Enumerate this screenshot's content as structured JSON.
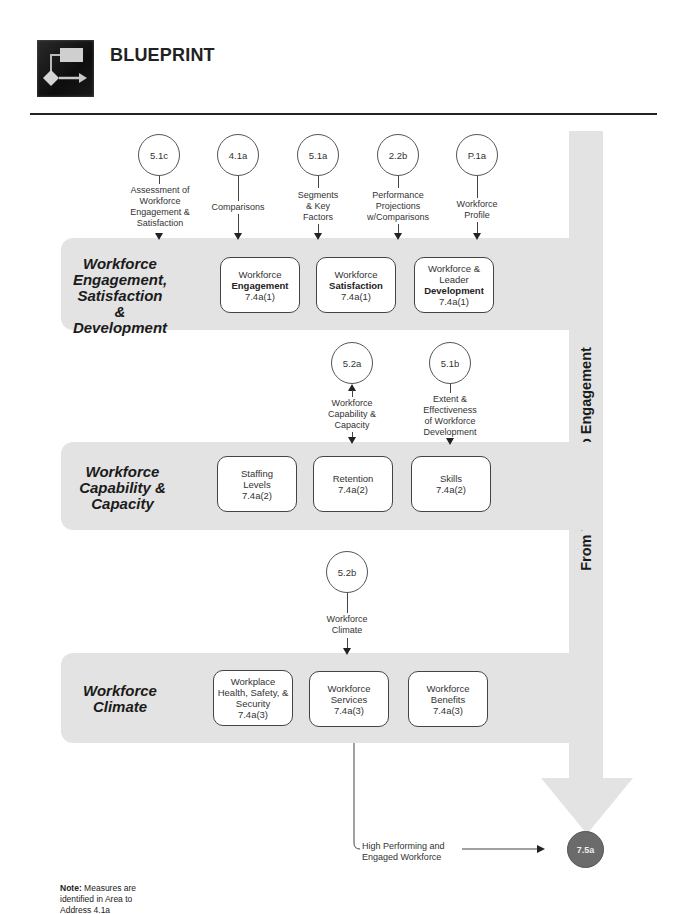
{
  "header": {
    "logo_icon": "flowchart-blueprint-icon",
    "title": "BLUEPRINT"
  },
  "flow_label": "From Well-Being to Engagement",
  "bands": [
    {
      "label": "Workforce Engagement, Satisfaction & Development",
      "label_lines": [
        "Workforce",
        "Engagement,",
        "Satisfaction &",
        "Development"
      ],
      "inputs": [
        {
          "ref": "5.1c",
          "label_lines": [
            "Assessment of",
            "Workforce",
            "Engagement &",
            "Satisfaction"
          ]
        },
        {
          "ref": "4.1a",
          "label_lines": [
            "Comparisons"
          ]
        },
        {
          "ref": "5.1a",
          "label_lines": [
            "Segments",
            "& Key",
            "Factors"
          ]
        },
        {
          "ref": "2.2b",
          "label_lines": [
            "Performance",
            "Projections",
            "w/Comparisons"
          ]
        },
        {
          "ref": "P.1a",
          "label_lines": [
            "Workforce",
            "Profile"
          ]
        }
      ],
      "boxes": [
        {
          "line1": "Workforce",
          "bold": "Engagement",
          "ref": "7.4a(1)"
        },
        {
          "line1": "Workforce",
          "bold": "Satisfaction",
          "ref": "7.4a(1)"
        },
        {
          "line1": "Workforce &",
          "line2": "Leader",
          "bold": "Development",
          "ref": "7.4a(1)"
        }
      ]
    },
    {
      "label": "Workforce Capability & Capacity",
      "label_lines": [
        "Workforce",
        "Capability &",
        "Capacity"
      ],
      "inputs": [
        {
          "ref": "5.2a",
          "label_lines": [
            "Workforce",
            "Capability &",
            "Capacity"
          ],
          "bidirectional": true
        },
        {
          "ref": "5.1b",
          "label_lines": [
            "Extent &",
            "Effectiveness",
            "of Workforce",
            "Development"
          ]
        }
      ],
      "boxes": [
        {
          "line1": "Staffing",
          "line2": "Levels",
          "ref": "7.4a(2)"
        },
        {
          "line1": "Retention",
          "ref": "7.4a(2)"
        },
        {
          "line1": "Skills",
          "ref": "7.4a(2)"
        }
      ]
    },
    {
      "label": "Workforce Climate",
      "label_lines": [
        "Workforce",
        "Climate"
      ],
      "inputs": [
        {
          "ref": "5.2b",
          "label_lines": [
            "Workforce",
            "Climate"
          ]
        }
      ],
      "boxes": [
        {
          "line1": "Workplace",
          "line2": "Health, Safety, &",
          "line3": "Security",
          "ref": "7.4a(3)"
        },
        {
          "line1": "Workforce",
          "line2": "Services",
          "ref": "7.4a(3)"
        },
        {
          "line1": "Workforce",
          "line2": "Benefits",
          "ref": "7.4a(3)"
        }
      ]
    }
  ],
  "output": {
    "label_lines": [
      "High Performing and",
      "Engaged Workforce"
    ],
    "ref": "7.5a",
    "color": "#6b6b6b"
  },
  "note": {
    "bold": "Note:",
    "text_lines": [
      "Measures are",
      "identified in Area to",
      "Address 4.1a"
    ]
  },
  "colors": {
    "band_fill": "#e3e3e3",
    "rule": "#222222",
    "end_circle": "#6b6b6b"
  }
}
